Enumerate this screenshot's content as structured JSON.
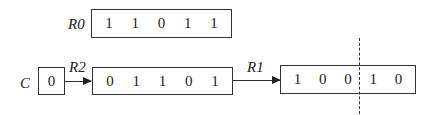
{
  "registers": {
    "r0": {
      "label": "R0",
      "bits": [
        "1",
        "1",
        "0",
        "1",
        "1"
      ]
    },
    "c": {
      "label": "C",
      "bits": [
        "0"
      ]
    },
    "r2": {
      "label": "R2",
      "bits": [
        "0",
        "1",
        "1",
        "0",
        "1"
      ]
    },
    "r1": {
      "label": "R1",
      "bits": [
        "1",
        "0",
        "0",
        "1",
        "0"
      ]
    }
  }
}
